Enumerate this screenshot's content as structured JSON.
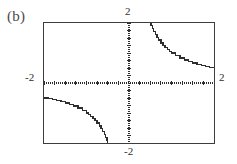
{
  "figure": {
    "part_label": "(b)",
    "ink_color": "#2e2e2e",
    "frame_color": "#3d3d3d",
    "background_color": "#ffffff"
  },
  "axis_labels": {
    "y_max": "2",
    "y_min": "-2",
    "x_min": "-2",
    "x_max": "2"
  },
  "chart_data": {
    "type": "line",
    "title": "(b)",
    "xlabel": "",
    "ylabel": "",
    "xlim": [
      -2,
      2
    ],
    "ylim": [
      -2,
      2
    ],
    "grid": false,
    "legend": null,
    "axes_style": "dotted-crosshair-centered",
    "x_tick_labels": [
      "-2",
      "2"
    ],
    "y_tick_labels": [
      "-2",
      "2"
    ],
    "x_tick_interval": 0.25,
    "y_tick_interval": 0.25,
    "series": [
      {
        "name": "y = 1/x (x > 0)",
        "x": [
          0.5,
          0.52,
          0.55,
          0.58,
          0.62,
          0.66,
          0.7,
          0.75,
          0.8,
          0.85,
          0.9,
          0.95,
          1.0,
          1.1,
          1.2,
          1.3,
          1.4,
          1.5,
          1.6,
          1.7,
          1.8,
          1.9,
          2.0
        ],
        "y": [
          2.0,
          1.923,
          1.818,
          1.724,
          1.613,
          1.515,
          1.429,
          1.333,
          1.25,
          1.176,
          1.111,
          1.053,
          1.0,
          0.909,
          0.833,
          0.769,
          0.714,
          0.667,
          0.625,
          0.588,
          0.556,
          0.526,
          0.5
        ]
      },
      {
        "name": "y = 1/x (x < 0)",
        "x": [
          -2.0,
          -1.9,
          -1.8,
          -1.7,
          -1.6,
          -1.5,
          -1.4,
          -1.3,
          -1.2,
          -1.1,
          -1.0,
          -0.95,
          -0.9,
          -0.85,
          -0.8,
          -0.75,
          -0.7,
          -0.66,
          -0.62,
          -0.58,
          -0.55,
          -0.52,
          -0.5
        ],
        "y": [
          -0.5,
          -0.526,
          -0.556,
          -0.588,
          -0.625,
          -0.667,
          -0.714,
          -0.769,
          -0.833,
          -0.909,
          -1.0,
          -1.053,
          -1.111,
          -1.176,
          -1.25,
          -1.333,
          -1.429,
          -1.515,
          -1.613,
          -1.724,
          -1.818,
          -1.923,
          -2.0
        ]
      }
    ]
  }
}
